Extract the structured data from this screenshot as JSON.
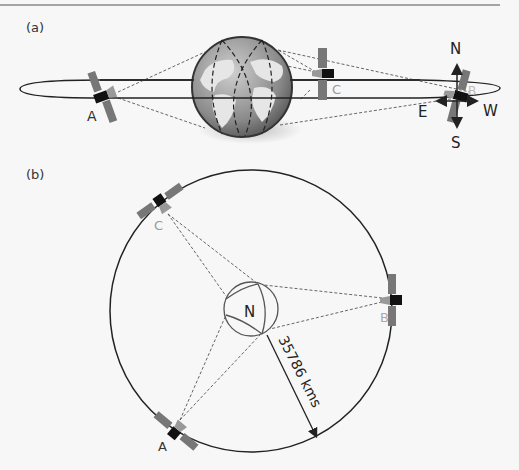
{
  "figure": {
    "panel_a": {
      "label": "(a)",
      "satellites": [
        {
          "id": "A",
          "label": "A"
        },
        {
          "id": "C",
          "label": "C"
        },
        {
          "id": "B",
          "label": "B"
        }
      ],
      "compass": {
        "north": "N",
        "south": "S",
        "east": "E",
        "west": "W"
      }
    },
    "panel_b": {
      "label": "(b)",
      "center_label": "N",
      "satellites": [
        {
          "id": "C",
          "label": "C"
        },
        {
          "id": "B",
          "label": "B"
        },
        {
          "id": "A",
          "label": "A"
        }
      ],
      "radius_label": "35786 kms"
    },
    "colors": {
      "line": "#222222",
      "satellite_body": "#111111",
      "solar_panel": "#777777",
      "label_gray": "#999999",
      "globe_ocean": "#8c8c8c",
      "globe_land": "#e6e6e6"
    }
  }
}
